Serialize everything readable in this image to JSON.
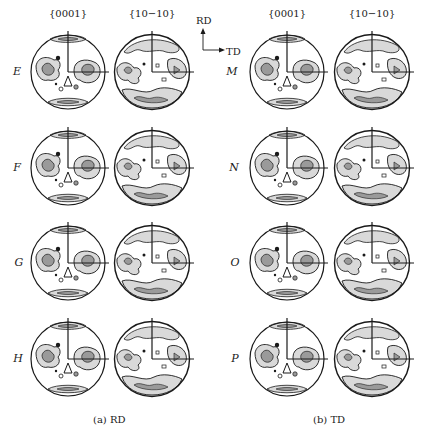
{
  "figure": {
    "panels": [
      {
        "id": "a",
        "caption": "(a) RD",
        "column_headers": [
          "{0001}",
          "{10−10}"
        ],
        "rows": [
          {
            "label": "E"
          },
          {
            "label": "F"
          },
          {
            "label": "G"
          },
          {
            "label": "H"
          }
        ]
      },
      {
        "id": "b",
        "caption": "(b) TD",
        "column_headers": [
          "{0001}",
          "{10−10}"
        ],
        "rows": [
          {
            "label": "M"
          },
          {
            "label": "N"
          },
          {
            "label": "O"
          },
          {
            "label": "P"
          }
        ]
      }
    ],
    "axes_indicator": {
      "vertical": "RD",
      "horizontal": "TD"
    },
    "colors": {
      "line": "#1a1a1a",
      "contour_fill_light": "#d9d9d9",
      "contour_fill_mid": "#9a9a9a",
      "background": "#ffffff"
    }
  }
}
